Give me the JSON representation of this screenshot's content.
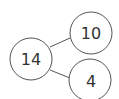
{
  "diagram": {
    "type": "number-bond",
    "whole": {
      "value": "14"
    },
    "parts": [
      {
        "value": "10"
      },
      {
        "value": "4"
      }
    ],
    "stroke_color": "#555555",
    "text_color": "#333333"
  }
}
